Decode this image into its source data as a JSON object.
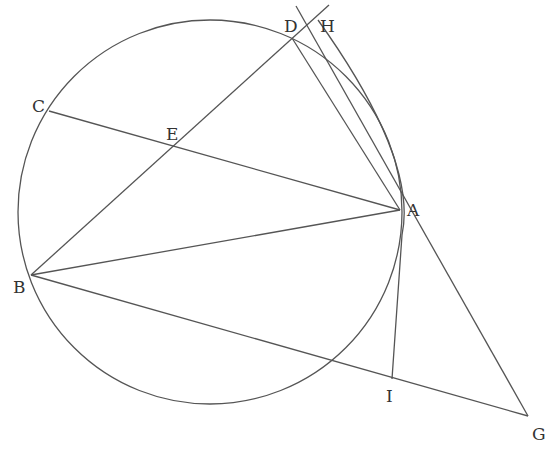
{
  "diagram": {
    "type": "geometry",
    "circle": {
      "cx": 210,
      "cy": 212,
      "r": 192
    },
    "points": {
      "A": {
        "x": 400,
        "y": 210,
        "label": "A"
      },
      "B": {
        "x": 31,
        "y": 275,
        "label": "B"
      },
      "C": {
        "x": 49,
        "y": 111,
        "label": "C"
      },
      "D": {
        "x": 292,
        "y": 38,
        "label": "D"
      },
      "E": {
        "x": 172,
        "y": 146,
        "label": "E"
      },
      "G": {
        "x": 540,
        "y": 420,
        "label": "G"
      },
      "H": {
        "x": 310,
        "y": 20,
        "label": "H"
      },
      "I": {
        "x": 392,
        "y": 379,
        "label": "I"
      }
    },
    "segments": [
      [
        "B",
        "D_ext"
      ],
      [
        "C",
        "A"
      ],
      [
        "B",
        "A"
      ],
      [
        "B",
        "G"
      ],
      [
        "D",
        "A"
      ],
      [
        "G",
        "H_ext"
      ]
    ],
    "arcs": [
      "circle through A,B,C,D",
      "arc H-A-I"
    ]
  }
}
